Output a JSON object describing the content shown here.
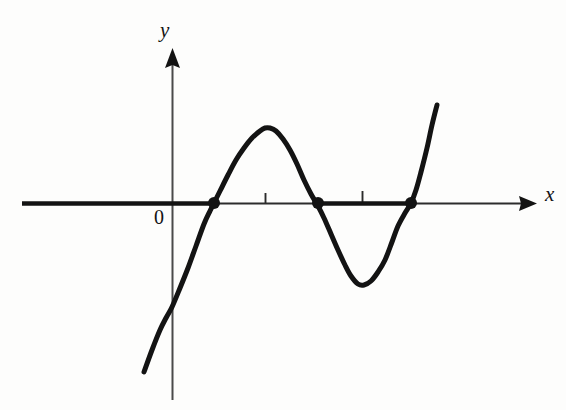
{
  "figure": {
    "kind": "coordinate-plane-graph",
    "width": 566,
    "height": 410,
    "background_color": "#fdfdfc",
    "ink_color": "#131313"
  },
  "labels": {
    "y_axis": "y",
    "x_axis": "x",
    "origin": "0"
  },
  "chart_data": {
    "type": "line",
    "title": "",
    "subtitle": "",
    "xlabel": "x",
    "ylabel": "y",
    "legend": [],
    "grid": false,
    "legend_position": "none",
    "axes": {
      "x_axis": {
        "label": "x",
        "pixel_y": 203,
        "pixel_start_x": 22,
        "pixel_end_x": 537,
        "arrow": "right",
        "arrow_tip_x": 537,
        "tick_marks_pixel_x": [
          265,
          362
        ],
        "tick_labels": []
      },
      "y_axis": {
        "label": "y",
        "pixel_x": 172,
        "pixel_start_y": 400,
        "pixel_end_y": 48,
        "arrow": "up",
        "arrow_tip_y": 48,
        "tick_marks_pixel_y": [],
        "tick_labels": []
      },
      "origin_pixel": [
        172,
        203
      ]
    },
    "x": [
      144,
      160,
      172,
      186,
      200,
      214,
      228,
      243,
      257,
      265,
      276,
      290,
      304,
      318,
      332,
      345,
      358,
      372,
      385,
      398,
      411,
      420,
      430,
      437
    ],
    "y": [
      372,
      330,
      307,
      275,
      240,
      203,
      171,
      145,
      130,
      128,
      134,
      152,
      177,
      203,
      236,
      266,
      285,
      282,
      262,
      234,
      203,
      172,
      134,
      105
    ],
    "series": [
      {
        "name": "cubic-curve",
        "stroke_width": 5,
        "color": "#131313",
        "points_pixel": [
          [
            144,
            372
          ],
          [
            152,
            350
          ],
          [
            160,
            330
          ],
          [
            166,
            318
          ],
          [
            172,
            307
          ],
          [
            180,
            288
          ],
          [
            188,
            268
          ],
          [
            196,
            246
          ],
          [
            204,
            224
          ],
          [
            210,
            211
          ],
          [
            214,
            203
          ],
          [
            220,
            191
          ],
          [
            228,
            175
          ],
          [
            236,
            160
          ],
          [
            244,
            148
          ],
          [
            252,
            138
          ],
          [
            260,
            131
          ],
          [
            265,
            128
          ],
          [
            270,
            128
          ],
          [
            276,
            131
          ],
          [
            283,
            139
          ],
          [
            290,
            150
          ],
          [
            297,
            164
          ],
          [
            304,
            180
          ],
          [
            311,
            194
          ],
          [
            318,
            206
          ],
          [
            324,
            218
          ],
          [
            331,
            234
          ],
          [
            338,
            250
          ],
          [
            345,
            265
          ],
          [
            351,
            276
          ],
          [
            358,
            284
          ],
          [
            364,
            285
          ],
          [
            371,
            281
          ],
          [
            378,
            272
          ],
          [
            385,
            260
          ],
          [
            392,
            242
          ],
          [
            398,
            226
          ],
          [
            405,
            213
          ],
          [
            411,
            203
          ],
          [
            416,
            190
          ],
          [
            421,
            172
          ],
          [
            427,
            148
          ],
          [
            432,
            125
          ],
          [
            437,
            105
          ]
        ]
      }
    ],
    "roots": [
      {
        "name": "root-1",
        "pixel": [
          214,
          203
        ],
        "marker": "filled-dot",
        "radius": 6
      },
      {
        "name": "root-2",
        "pixel": [
          318,
          203
        ],
        "marker": "filled-dot",
        "radius": 6
      },
      {
        "name": "root-3",
        "pixel": [
          411,
          203
        ],
        "marker": "filled-dot",
        "radius": 6
      }
    ],
    "extrema": [
      {
        "name": "local-maximum",
        "pixel": [
          266,
          128
        ]
      },
      {
        "name": "local-minimum",
        "pixel": [
          360,
          285
        ]
      }
    ],
    "notes": {
      "left_tail_end_pixel": [
        144,
        372
      ],
      "right_tail_end_pixel": [
        437,
        105
      ],
      "y_intercept_pixel": [
        172,
        307
      ]
    }
  }
}
